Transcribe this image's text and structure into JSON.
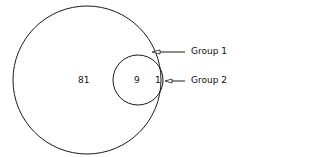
{
  "diagram": {
    "type": "venn",
    "regions": {
      "group1_only": "81",
      "overlap": "9",
      "group2_only": "1"
    },
    "labels": {
      "group1": "Group 1",
      "group2": "Group 2"
    },
    "colors": {
      "stroke": "#1a1a1a",
      "background": "#ffffff"
    }
  }
}
